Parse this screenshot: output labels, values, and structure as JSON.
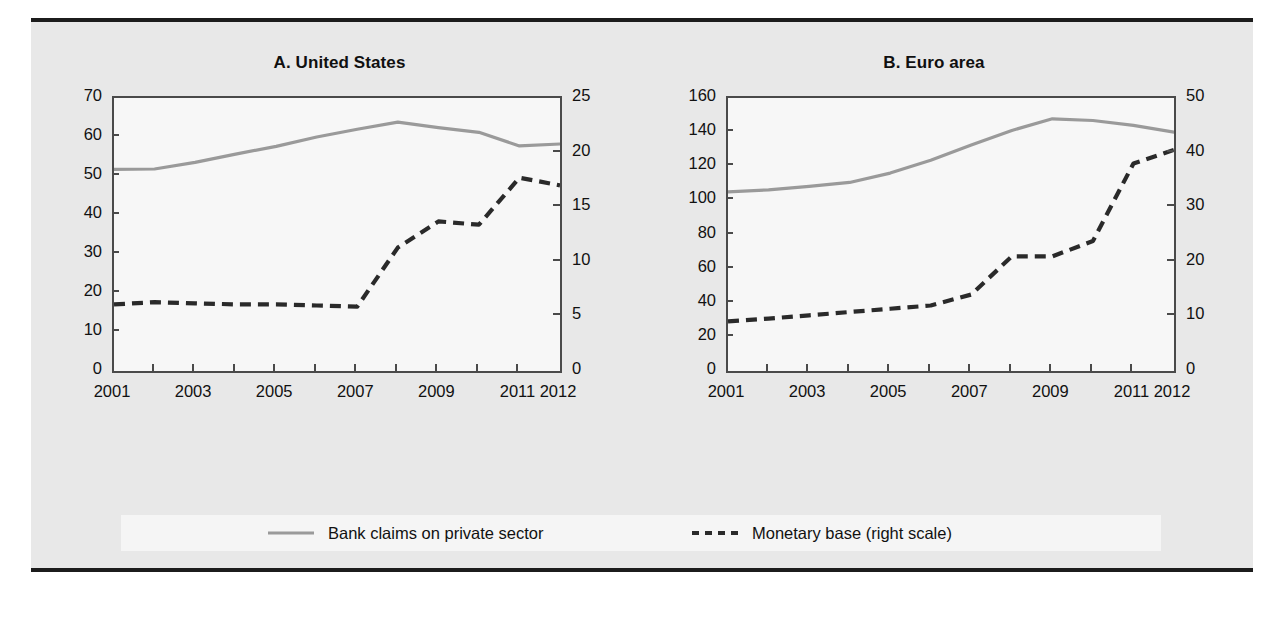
{
  "figure": {
    "panels": [
      {
        "id": "A",
        "title": "A. United States",
        "y_left_ticks": [
          "0",
          "10",
          "20",
          "30",
          "40",
          "50",
          "60",
          "70"
        ],
        "y_right_ticks": [
          "0",
          "5",
          "10",
          "15",
          "20",
          "25"
        ],
        "x_ticks": [
          "2001",
          "2003",
          "2005",
          "2007",
          "2009",
          "2011",
          "2012"
        ]
      },
      {
        "id": "B",
        "title": "B. Euro area",
        "y_left_ticks": [
          "0",
          "20",
          "40",
          "60",
          "80",
          "100",
          "120",
          "140",
          "160"
        ],
        "y_right_ticks": [
          "0",
          "10",
          "20",
          "30",
          "40",
          "50"
        ],
        "x_ticks": [
          "2001",
          "2003",
          "2005",
          "2007",
          "2009",
          "2011",
          "2012"
        ]
      }
    ],
    "legend": {
      "items": [
        {
          "label": "Bank claims on private sector",
          "style": "solid",
          "color": "#9a9a9a"
        },
        {
          "label": "Monetary base (right scale)",
          "style": "dashed",
          "color": "#2a2a2a"
        }
      ]
    },
    "colors": {
      "background": "#e8e8e8",
      "plot_background": "#f7f7f7",
      "legend_background": "#f5f5f5",
      "rule": "#1c1c1c",
      "axis": "#4a4a4a",
      "text": "#111111",
      "series_solid": "#9a9a9a",
      "series_dashed": "#2a2a2a"
    }
  },
  "chart_data": [
    {
      "type": "line",
      "title": "A. United States",
      "xlabel": "",
      "ylabel": "",
      "grid": false,
      "legend_position": "bottom",
      "x": [
        2001,
        2002,
        2003,
        2004,
        2005,
        2006,
        2007,
        2008,
        2009,
        2010,
        2011,
        2012
      ],
      "xlim": [
        2001,
        2012
      ],
      "axes": [
        {
          "side": "left",
          "ylim": [
            0,
            70
          ],
          "ticks": [
            0,
            10,
            20,
            30,
            40,
            50,
            60,
            70
          ]
        },
        {
          "side": "right",
          "ylim": [
            0,
            25
          ],
          "ticks": [
            0,
            5,
            10,
            15,
            20,
            25
          ]
        }
      ],
      "series": [
        {
          "name": "Bank claims on private sector",
          "axis": "left",
          "style": "solid",
          "color": "#9a9a9a",
          "values": [
            51.7,
            51.8,
            53.5,
            55.6,
            57.6,
            60.0,
            62.0,
            63.8,
            62.4,
            61.2,
            57.7,
            58.2
          ]
        },
        {
          "name": "Monetary base (right scale)",
          "axis": "right",
          "style": "dashed",
          "color": "#2a2a2a",
          "values": [
            6.1,
            6.3,
            6.2,
            6.1,
            6.1,
            6.0,
            5.9,
            11.3,
            13.7,
            13.4,
            17.7,
            17.0
          ]
        }
      ]
    },
    {
      "type": "line",
      "title": "B. Euro area",
      "xlabel": "",
      "ylabel": "",
      "grid": false,
      "legend_position": "bottom",
      "x": [
        2001,
        2002,
        2003,
        2004,
        2005,
        2006,
        2007,
        2008,
        2009,
        2010,
        2011,
        2012
      ],
      "xlim": [
        2001,
        2012
      ],
      "axes": [
        {
          "side": "left",
          "ylim": [
            0,
            160
          ],
          "ticks": [
            0,
            20,
            40,
            60,
            80,
            100,
            120,
            140,
            160
          ]
        },
        {
          "side": "right",
          "ylim": [
            0,
            50
          ],
          "ticks": [
            0,
            10,
            20,
            30,
            40,
            50
          ]
        }
      ],
      "series": [
        {
          "name": "Bank claims on private sector",
          "axis": "left",
          "style": "solid",
          "color": "#9a9a9a",
          "values": [
            105.0,
            106.2,
            108.2,
            110.5,
            116.0,
            123.5,
            132.5,
            141.0,
            147.8,
            146.8,
            144.0,
            140.0
          ]
        },
        {
          "name": "Monetary base (right scale)",
          "axis": "right",
          "style": "dashed",
          "color": "#2a2a2a",
          "values": [
            9.1,
            9.6,
            10.2,
            10.8,
            11.4,
            12.0,
            14.0,
            21.0,
            21.0,
            23.8,
            38.0,
            40.5
          ]
        }
      ]
    }
  ]
}
